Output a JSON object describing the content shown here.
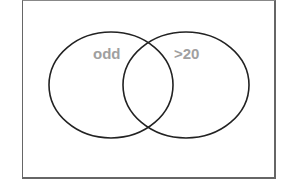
{
  "diagram": {
    "type": "venn",
    "sets": [
      {
        "label": "odd",
        "cx": 111,
        "cy": 85,
        "rx": 63,
        "ry": 53
      },
      {
        "label": ">20",
        "cx": 186,
        "cy": 85,
        "rx": 63,
        "ry": 53
      }
    ],
    "colors": {
      "outline": "#222222",
      "label": "#a0a0a0",
      "frame": "#666666"
    }
  }
}
